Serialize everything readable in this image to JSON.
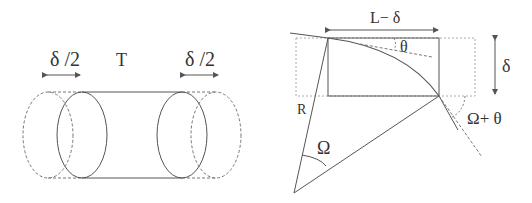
{
  "left_figure": {
    "labels": {
      "left_shift": "δ /2",
      "tension": "T",
      "right_shift": "δ /2"
    }
  },
  "right_figure": {
    "labels": {
      "chord_length": "L− δ",
      "theta": "θ",
      "delta": "δ",
      "radius": "R",
      "omega": "Ω",
      "omega_plus_theta": "Ω+ θ"
    }
  },
  "colors": {
    "stroke": "#555555",
    "dashed": "#777777",
    "text": "#333333"
  }
}
